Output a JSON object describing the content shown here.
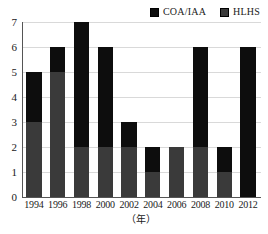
{
  "chart_data": {
    "type": "bar",
    "subtype": "stacked-vertical-bar",
    "title": "",
    "xlabel": "（年）",
    "ylabel": "",
    "ylim": [
      0,
      7
    ],
    "yticks": [
      0,
      1,
      2,
      3,
      4,
      5,
      6,
      7
    ],
    "grid": true,
    "legend_position": "top-right",
    "categories": [
      "1994",
      "1996",
      "1998",
      "2000",
      "2002",
      "2004",
      "2006",
      "2008",
      "2010",
      "2012"
    ],
    "series": [
      {
        "name": "COA/IAA",
        "color": "#3a3a3a",
        "stack_position": "bottom",
        "values": [
          3,
          5,
          2,
          2,
          2,
          1,
          2,
          2,
          1,
          0
        ]
      },
      {
        "name": "HLHS",
        "color": "#0d0d0d",
        "stack_position": "top",
        "values": [
          2,
          1,
          5,
          4,
          1,
          1,
          0,
          4,
          1,
          6
        ]
      }
    ],
    "totals": [
      5,
      6,
      7,
      6,
      3,
      2,
      2,
      6,
      2,
      6
    ]
  },
  "legend": {
    "entries": [
      {
        "label": "COA/IAA",
        "color": "#0d0d0d"
      },
      {
        "label": "HLHS",
        "color": "#3a3a3a"
      }
    ]
  },
  "axes": {
    "y_tick_labels": [
      "7",
      "6",
      "5",
      "4",
      "3",
      "2",
      "1",
      "0"
    ],
    "x_tick_labels": [
      "1994",
      "1996",
      "1998",
      "2000",
      "2002",
      "2004",
      "2006",
      "2008",
      "2010",
      "2012"
    ],
    "x_axis_title": "（年）"
  }
}
